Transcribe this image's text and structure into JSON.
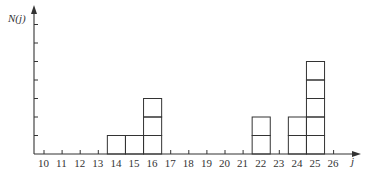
{
  "chart_data": {
    "type": "bar",
    "title": "",
    "xlabel": "j",
    "ylabel": "N(j)",
    "categories": [
      "10",
      "11",
      "12",
      "13",
      "14",
      "15",
      "16",
      "17",
      "18",
      "19",
      "20",
      "21",
      "22",
      "23",
      "24",
      "25",
      "26"
    ],
    "values": [
      0,
      0,
      0,
      0,
      1,
      1,
      3,
      0,
      0,
      0,
      0,
      0,
      2,
      0,
      2,
      5,
      0
    ],
    "style": "stacked unit boxes (each box = 1 count)",
    "ylim": [
      0,
      7
    ],
    "y_ticks_count": 7,
    "grid": false,
    "legend": null
  },
  "axis": {
    "y_label": "N(j)",
    "x_label": "j",
    "tick_labels": [
      "10",
      "11",
      "12",
      "13",
      "14",
      "15",
      "16",
      "17",
      "18",
      "19",
      "20",
      "21",
      "22",
      "23",
      "24",
      "25",
      "26"
    ]
  }
}
